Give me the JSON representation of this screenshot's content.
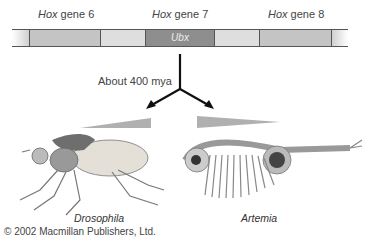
{
  "gene_labels": [
    {
      "italic": "Hox",
      "rest": " gene 6"
    },
    {
      "italic": "Hox",
      "rest": " gene 7"
    },
    {
      "italic": "Hox",
      "rest": " gene 8"
    }
  ],
  "bar": {
    "highlight_label": "Ubx",
    "colors": {
      "mid": "#c4c4c4",
      "light": "#dedede",
      "dark": "#8e8e8e",
      "line": "#555555"
    }
  },
  "divergence_label": "About 400 mya",
  "organisms": [
    {
      "name": "Drosophila"
    },
    {
      "name": "Artemia"
    }
  ],
  "copyright": "© 2002 Macmillan Publishers, Ltd."
}
